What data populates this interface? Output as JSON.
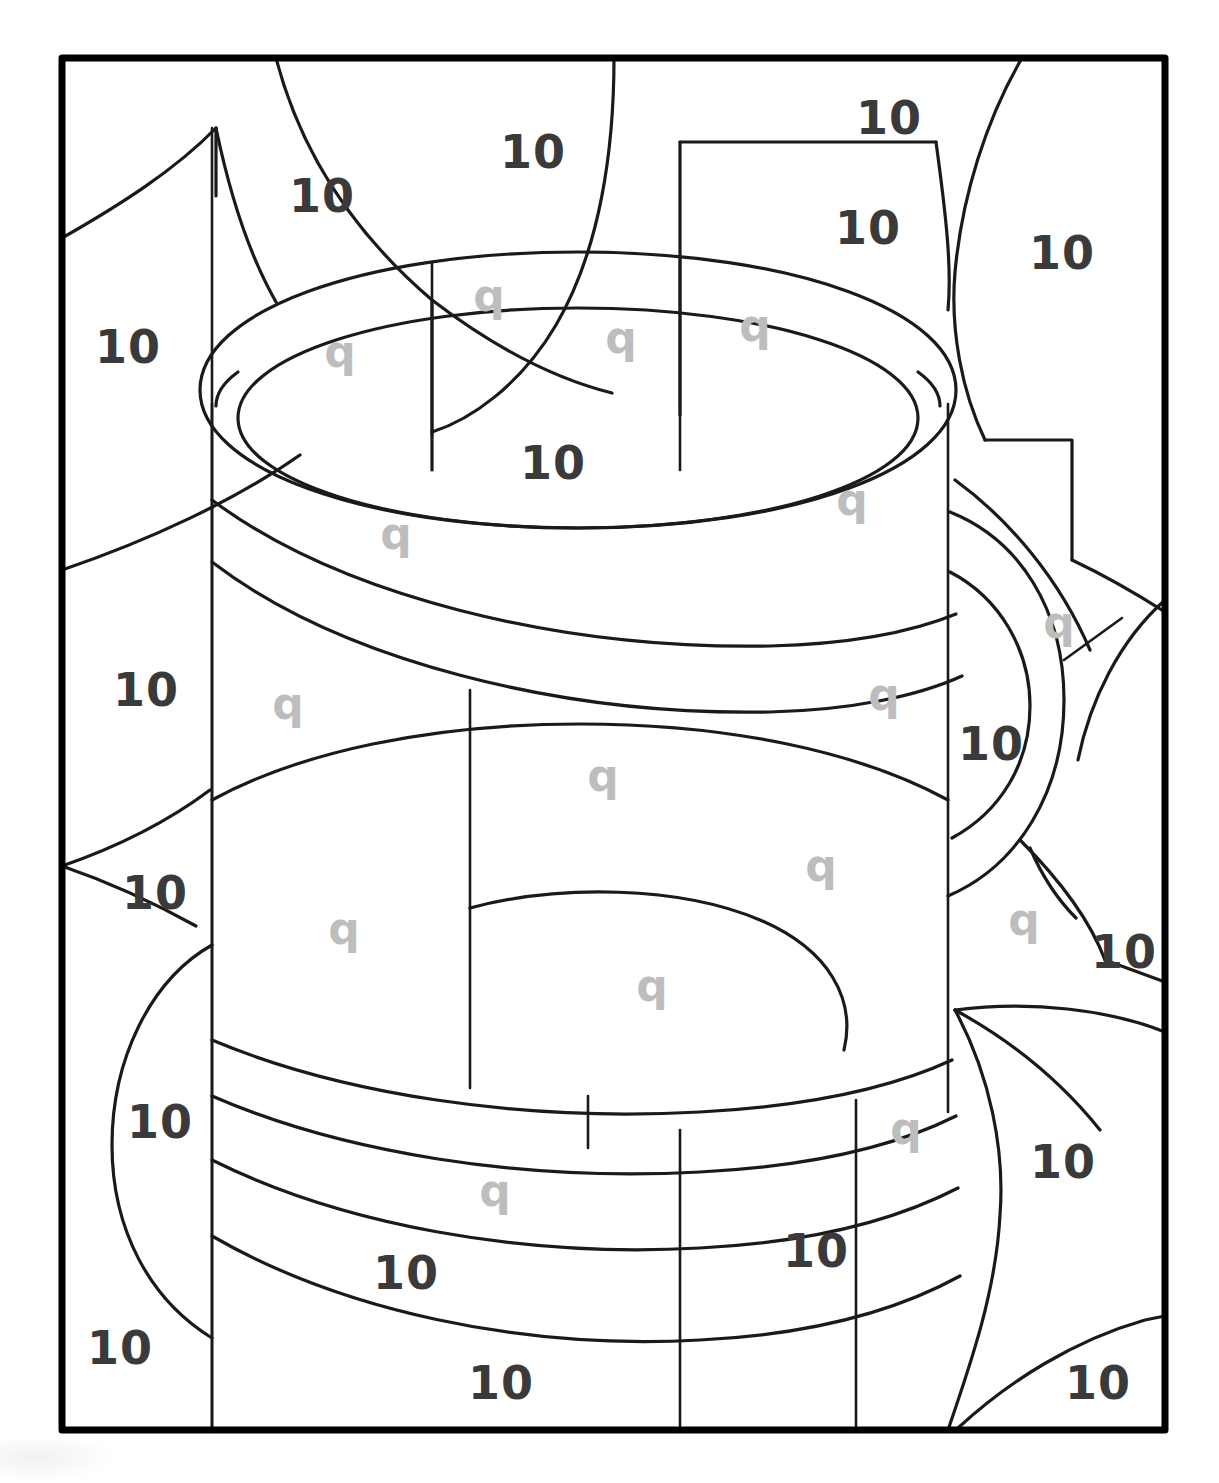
{
  "page": {
    "kind": "color-by-number-worksheet",
    "width": 1219,
    "height": 1483,
    "background_color": "#ffffff",
    "frame": {
      "x": 62,
      "y": 58,
      "width": 1103,
      "height": 1372,
      "stroke_color": "#000000",
      "stroke_width": 7
    }
  },
  "colors": {
    "number_label": "#3a3a3a",
    "letter_label": "#bdbdbd",
    "outline": "#1a1a1a",
    "frame": "#000000",
    "paper": "#ffffff"
  },
  "legend": {
    "number_symbol": "10",
    "letter_symbol": "q"
  },
  "labels": [
    {
      "id": "num-01",
      "text": "10",
      "x": 322,
      "y": 196,
      "kind": "number"
    },
    {
      "id": "num-02",
      "text": "10",
      "x": 533,
      "y": 152,
      "kind": "number"
    },
    {
      "id": "num-03",
      "text": "10",
      "x": 889,
      "y": 118,
      "kind": "number"
    },
    {
      "id": "num-04",
      "text": "10",
      "x": 868,
      "y": 228,
      "kind": "number"
    },
    {
      "id": "num-05",
      "text": "10",
      "x": 1062,
      "y": 253,
      "kind": "number"
    },
    {
      "id": "num-06",
      "text": "10",
      "x": 128,
      "y": 347,
      "kind": "number"
    },
    {
      "id": "q-01",
      "text": "q",
      "x": 489,
      "y": 296,
      "kind": "letter"
    },
    {
      "id": "q-02",
      "text": "q",
      "x": 340,
      "y": 352,
      "kind": "letter"
    },
    {
      "id": "q-03",
      "text": "q",
      "x": 621,
      "y": 338,
      "kind": "letter"
    },
    {
      "id": "q-04",
      "text": "q",
      "x": 755,
      "y": 326,
      "kind": "letter"
    },
    {
      "id": "num-07",
      "text": "10",
      "x": 553,
      "y": 463,
      "kind": "number"
    },
    {
      "id": "q-05",
      "text": "q",
      "x": 396,
      "y": 534,
      "kind": "letter"
    },
    {
      "id": "q-06",
      "text": "q",
      "x": 852,
      "y": 500,
      "kind": "letter"
    },
    {
      "id": "q-07",
      "text": "q",
      "x": 1059,
      "y": 623,
      "kind": "letter"
    },
    {
      "id": "num-08",
      "text": "10",
      "x": 146,
      "y": 690,
      "kind": "number"
    },
    {
      "id": "q-08",
      "text": "q",
      "x": 288,
      "y": 704,
      "kind": "letter"
    },
    {
      "id": "q-09",
      "text": "q",
      "x": 884,
      "y": 695,
      "kind": "letter"
    },
    {
      "id": "num-09",
      "text": "10",
      "x": 991,
      "y": 744,
      "kind": "number"
    },
    {
      "id": "q-10",
      "text": "q",
      "x": 603,
      "y": 776,
      "kind": "letter"
    },
    {
      "id": "q-11",
      "text": "q",
      "x": 821,
      "y": 866,
      "kind": "letter"
    },
    {
      "id": "num-10",
      "text": "10",
      "x": 155,
      "y": 893,
      "kind": "number"
    },
    {
      "id": "q-12",
      "text": "q",
      "x": 344,
      "y": 929,
      "kind": "letter"
    },
    {
      "id": "q-13",
      "text": "q",
      "x": 1024,
      "y": 920,
      "kind": "letter"
    },
    {
      "id": "num-11",
      "text": "10",
      "x": 1124,
      "y": 952,
      "kind": "number"
    },
    {
      "id": "q-14",
      "text": "q",
      "x": 652,
      "y": 986,
      "kind": "letter"
    },
    {
      "id": "num-12",
      "text": "10",
      "x": 160,
      "y": 1122,
      "kind": "number"
    },
    {
      "id": "q-15",
      "text": "q",
      "x": 906,
      "y": 1129,
      "kind": "letter"
    },
    {
      "id": "num-13",
      "text": "10",
      "x": 1063,
      "y": 1162,
      "kind": "number"
    },
    {
      "id": "q-16",
      "text": "q",
      "x": 495,
      "y": 1191,
      "kind": "letter"
    },
    {
      "id": "num-14",
      "text": "10",
      "x": 406,
      "y": 1273,
      "kind": "number"
    },
    {
      "id": "num-15",
      "text": "10",
      "x": 816,
      "y": 1251,
      "kind": "number"
    },
    {
      "id": "num-16",
      "text": "10",
      "x": 120,
      "y": 1348,
      "kind": "number"
    },
    {
      "id": "num-17",
      "text": "10",
      "x": 501,
      "y": 1383,
      "kind": "number"
    },
    {
      "id": "num-18",
      "text": "10",
      "x": 1098,
      "y": 1383,
      "kind": "number"
    }
  ]
}
